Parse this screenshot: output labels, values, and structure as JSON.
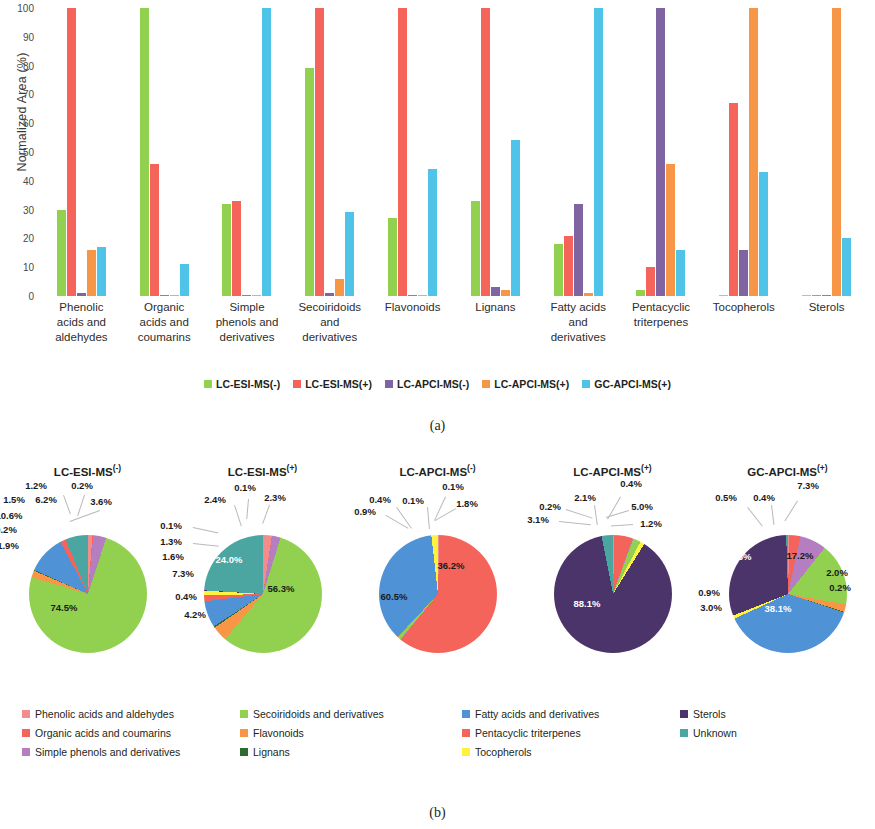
{
  "figure": {
    "caption_a": "(a)",
    "caption_b": "(b)"
  },
  "colors": {
    "lc_esi_neg": "#92D14F",
    "lc_esi_pos": "#F4645A",
    "lc_apci_neg": "#8064A2",
    "lc_apci_pos": "#F79646",
    "gc_apci_pos": "#4FC3E8",
    "phenolic_acids": "#F28D8D",
    "organic_acids": "#F4645A",
    "simple_phenols": "#B57EC1",
    "secoiridoids": "#92D14F",
    "flavonoids": "#F79646",
    "lignans": "#2E6B2E",
    "fatty_acids": "#4F93D6",
    "pentacyclic": "#F4645A",
    "tocopherols": "#FFF23F",
    "sterols": "#4B3469",
    "unknown": "#4BA5A0"
  },
  "chart_data": [
    {
      "type": "bar",
      "title": "",
      "xlabel": "",
      "ylabel": "Normalized Area (%)",
      "ylim": [
        0,
        100
      ],
      "yticks": [
        0,
        10,
        20,
        30,
        40,
        50,
        60,
        70,
        80,
        90,
        100
      ],
      "grid": false,
      "legend_position": "bottom",
      "categories": [
        "Phenolic acids and aldehydes",
        "Organic acids and coumarins",
        "Simple phenols and derivatives",
        "Secoiridoids and derivatives",
        "Flavonoids",
        "Lignans",
        "Fatty acids and derivatives",
        "Pentacyclic triterpenes",
        "Tocopherols",
        "Sterols"
      ],
      "category_lines": [
        [
          "Phenolic",
          "acids and",
          "aldehydes"
        ],
        [
          "Organic",
          "acids and",
          "coumarins"
        ],
        [
          "Simple",
          "phenols and",
          "derivatives"
        ],
        [
          "Secoiridoids",
          "and",
          "derivatives"
        ],
        [
          "Flavonoids"
        ],
        [
          "Lignans"
        ],
        [
          "Fatty acids",
          "and",
          "derivatives"
        ],
        [
          "Pentacyclic",
          "triterpenes"
        ],
        [
          "Tocopherols"
        ],
        [
          "Sterols"
        ]
      ],
      "series": [
        {
          "name": "LC-ESI-MS(-)",
          "color": "#92D14F",
          "values": [
            30,
            100,
            32,
            79,
            27,
            33,
            18,
            2,
            0,
            0
          ]
        },
        {
          "name": "LC-ESI-MS(+)",
          "color": "#F4645A",
          "values": [
            100,
            46,
            33,
            100,
            100,
            100,
            21,
            10,
            67,
            0
          ]
        },
        {
          "name": "LC-APCI-MS(-)",
          "color": "#8064A2",
          "values": [
            1,
            0,
            0,
            1,
            0,
            3,
            32,
            100,
            16,
            0
          ]
        },
        {
          "name": "LC-APCI-MS(+)",
          "color": "#F79646",
          "values": [
            16,
            0,
            0,
            6,
            0,
            2,
            1,
            46,
            100,
            100
          ]
        },
        {
          "name": "GC-APCI-MS(+)",
          "color": "#4FC3E8",
          "values": [
            17,
            11,
            100,
            29,
            44,
            54,
            100,
            16,
            43,
            20
          ]
        }
      ]
    },
    {
      "type": "pie",
      "title": "LC-ESI-MS(-)",
      "title_base": "LC-ESI-MS",
      "title_sup": "(-)",
      "labels": [
        "Phenolic acids and aldehydes",
        "Organic acids and coumarins",
        "Simple phenols and derivatives",
        "Secoiridoids and derivatives",
        "Flavonoids",
        "Lignans",
        "Fatty acids and derivatives",
        "Pentacyclic triterpenes",
        "Tocopherols",
        "Sterols",
        "Unknown"
      ],
      "values": [
        1.2,
        0.2,
        3.6,
        74.5,
        1.9,
        0.2,
        10.6,
        1.5,
        0.0,
        0.0,
        6.2
      ],
      "value_labels": [
        "1.2%",
        "0.2%",
        "3.6%",
        "74.5%",
        "1.9%",
        "0.2%",
        "10.6%",
        "1.5%",
        "",
        "",
        "6.2%"
      ]
    },
    {
      "type": "pie",
      "title": "LC-ESI-MS(+)",
      "title_base": "LC-ESI-MS",
      "title_sup": "(+)",
      "labels": [
        "Phenolic acids and aldehydes",
        "Organic acids and coumarins",
        "Simple phenols and derivatives",
        "Secoiridoids and derivatives",
        "Flavonoids",
        "Lignans",
        "Fatty acids and derivatives",
        "Pentacyclic triterpenes",
        "Tocopherols",
        "Sterols",
        "Unknown"
      ],
      "values": [
        2.4,
        0.1,
        2.3,
        56.3,
        4.2,
        0.4,
        7.3,
        1.6,
        1.3,
        0.1,
        24.0
      ],
      "value_labels": [
        "2.4%",
        "0.1%",
        "2.3%",
        "56.3%",
        "4.2%",
        "0.4%",
        "7.3%",
        "1.6%",
        "1.3%",
        "0.1%",
        "24.0%"
      ]
    },
    {
      "type": "pie",
      "title": "LC-APCI-MS(-)",
      "title_base": "LC-APCI-MS",
      "title_sup": "(-)",
      "labels": [
        "Phenolic acids and aldehydes",
        "Organic acids and coumarins",
        "Simple phenols and derivatives",
        "Secoiridoids and derivatives",
        "Flavonoids",
        "Lignans",
        "Fatty acids and derivatives",
        "Pentacyclic triterpenes",
        "Tocopherols",
        "Sterols",
        "Unknown"
      ],
      "values": [
        0.4,
        60.5,
        0.1,
        0.9,
        0.1,
        0.0,
        36.2,
        0.0,
        1.8,
        0.0,
        0.0
      ],
      "value_labels": [
        "0.4%",
        "60.5%",
        "0.1%",
        "0.9%",
        "0.1%",
        "",
        "36.2%",
        "",
        "1.8%",
        "",
        ""
      ]
    },
    {
      "type": "pie",
      "title": "LC-APCI-MS(+)",
      "title_base": "LC-APCI-MS",
      "title_sup": "(+)",
      "labels": [
        "Phenolic acids and aldehydes",
        "Organic acids and coumarins",
        "Simple phenols and derivatives",
        "Secoiridoids and derivatives",
        "Flavonoids",
        "Lignans",
        "Fatty acids and derivatives",
        "Pentacyclic triterpenes",
        "Tocopherols",
        "Sterols",
        "Unknown"
      ],
      "values": [
        0.4,
        5.0,
        0.2,
        2.1,
        0.0,
        0.0,
        0.0,
        0.0,
        1.2,
        88.1,
        3.1
      ],
      "value_labels": [
        "0.4%",
        "5.0%",
        "0.2%",
        "2.1%",
        "",
        "",
        "",
        "",
        "1.2%",
        "88.1%",
        "3.1%"
      ]
    },
    {
      "type": "pie",
      "title": "GC-APCI-MS(+)",
      "title_base": "GC-APCI-MS",
      "title_sup": "(+)",
      "labels": [
        "Phenolic acids and aldehydes",
        "Organic acids and coumarins",
        "Simple phenols and derivatives",
        "Secoiridoids and derivatives",
        "Flavonoids",
        "Lignans",
        "Fatty acids and derivatives",
        "Pentacyclic triterpenes",
        "Tocopherols",
        "Sterols",
        "Unknown"
      ],
      "values": [
        0.4,
        3.0,
        7.3,
        17.2,
        2.0,
        0.2,
        38.1,
        0.0,
        0.9,
        30.5,
        0.5
      ],
      "value_labels": [
        "0.4%",
        "3.0%",
        "7.3%",
        "17.2%",
        "2.0%",
        "0.2%",
        "38.1%",
        "",
        "0.9%",
        "30.5%",
        "0.5%"
      ]
    }
  ],
  "bar_legend": [
    {
      "label": "LC-ESI-MS(-)",
      "color": "#92D14F"
    },
    {
      "label": "LC-ESI-MS(+)",
      "color": "#F4645A"
    },
    {
      "label": "LC-APCI-MS(-)",
      "color": "#8064A2"
    },
    {
      "label": "LC-APCI-MS(+)",
      "color": "#F79646"
    },
    {
      "label": "GC-APCI-MS(+)",
      "color": "#4FC3E8"
    }
  ],
  "pie_legend": [
    {
      "label": "Phenolic acids and aldehydes",
      "color": "#F28D8D"
    },
    {
      "label": "Organic acids and coumarins",
      "color": "#F4645A"
    },
    {
      "label": "Simple phenols and derivatives",
      "color": "#B57EC1"
    },
    {
      "label": "Secoiridoids and derivatives",
      "color": "#92D14F"
    },
    {
      "label": "Flavonoids",
      "color": "#F79646"
    },
    {
      "label": "Lignans",
      "color": "#2E6B2E"
    },
    {
      "label": "Fatty acids and derivatives",
      "color": "#4F93D6"
    },
    {
      "label": "Pentacyclic triterpenes",
      "color": "#F4645A"
    },
    {
      "label": "Tocopherols",
      "color": "#FFF23F"
    },
    {
      "label": "Sterols",
      "color": "#4B3469"
    },
    {
      "label": "Unknown",
      "color": "#4BA5A0"
    }
  ],
  "pie_label_layout": [
    [
      {
        "t": "1.2%",
        "x": 36,
        "y": 30,
        "cls": ""
      },
      {
        "t": "1.5%",
        "x": 14,
        "y": 44,
        "cls": ""
      },
      {
        "t": "6.2%",
        "x": 46,
        "y": 44,
        "cls": ""
      },
      {
        "t": "10.6%",
        "x": 9,
        "y": 60,
        "cls": ""
      },
      {
        "t": "0.2%",
        "x": 6,
        "y": 74,
        "cls": ""
      },
      {
        "t": "1.9%",
        "x": 8,
        "y": 90,
        "cls": ""
      },
      {
        "t": "0.2%",
        "x": 82,
        "y": 30,
        "cls": ""
      },
      {
        "t": "3.6%",
        "x": 101,
        "y": 46,
        "cls": ""
      },
      {
        "t": "74.5%",
        "x": 64,
        "y": 152,
        "cls": "inside"
      }
    ],
    [
      {
        "t": "2.4%",
        "x": 40,
        "y": 44,
        "cls": ""
      },
      {
        "t": "0.1%",
        "x": 70,
        "y": 32,
        "cls": ""
      },
      {
        "t": "2.3%",
        "x": 100,
        "y": 42,
        "cls": ""
      },
      {
        "t": "0.1%",
        "x": -4,
        "y": 70,
        "cls": ""
      },
      {
        "t": "1.3%",
        "x": -4,
        "y": 86,
        "cls": ""
      },
      {
        "t": "1.6%",
        "x": -2,
        "y": 101,
        "cls": ""
      },
      {
        "t": "7.3%",
        "x": 8,
        "y": 118,
        "cls": ""
      },
      {
        "t": "0.4%",
        "x": 11,
        "y": 141,
        "cls": ""
      },
      {
        "t": "4.2%",
        "x": 20,
        "y": 159,
        "cls": ""
      },
      {
        "t": "24.0%",
        "x": 54,
        "y": 104,
        "cls": "inside-light"
      },
      {
        "t": "56.3%",
        "x": 106,
        "y": 133,
        "cls": "inside"
      }
    ],
    [
      {
        "t": "0.4%",
        "x": 30,
        "y": 44,
        "cls": ""
      },
      {
        "t": "0.1%",
        "x": 63,
        "y": 45,
        "cls": ""
      },
      {
        "t": "0.1%",
        "x": 103,
        "y": 31,
        "cls": ""
      },
      {
        "t": "0.9%",
        "x": 15,
        "y": 56,
        "cls": ""
      },
      {
        "t": "1.8%",
        "x": 117,
        "y": 48,
        "cls": ""
      },
      {
        "t": "36.2%",
        "x": 101,
        "y": 110,
        "cls": "inside"
      },
      {
        "t": "60.5%",
        "x": 44,
        "y": 141,
        "cls": "inside"
      }
    ],
    [
      {
        "t": "0.2%",
        "x": 25,
        "y": 51,
        "cls": ""
      },
      {
        "t": "3.1%",
        "x": 13,
        "y": 64,
        "cls": ""
      },
      {
        "t": "2.1%",
        "x": 60,
        "y": 42,
        "cls": ""
      },
      {
        "t": "0.4%",
        "x": 106,
        "y": 28,
        "cls": ""
      },
      {
        "t": "5.0%",
        "x": 117,
        "y": 51,
        "cls": ""
      },
      {
        "t": "1.2%",
        "x": 126,
        "y": 68,
        "cls": ""
      },
      {
        "t": "88.1%",
        "x": 62,
        "y": 148,
        "cls": "inside-light"
      }
    ],
    [
      {
        "t": "0.5%",
        "x": 26,
        "y": 42,
        "cls": ""
      },
      {
        "t": "0.4%",
        "x": 64,
        "y": 42,
        "cls": ""
      },
      {
        "t": "7.3%",
        "x": 108,
        "y": 30,
        "cls": ""
      },
      {
        "t": "17.2%",
        "x": 100,
        "y": 100,
        "cls": "inside"
      },
      {
        "t": "2.0%",
        "x": 137,
        "y": 117,
        "cls": ""
      },
      {
        "t": "0.2%",
        "x": 140,
        "y": 132,
        "cls": ""
      },
      {
        "t": "38.1%",
        "x": 78,
        "y": 153,
        "cls": "inside-light"
      },
      {
        "t": "3.0%",
        "x": 11,
        "y": 152,
        "cls": ""
      },
      {
        "t": "0.9%",
        "x": 9,
        "y": 137,
        "cls": ""
      },
      {
        "t": "30.5%",
        "x": 38,
        "y": 101,
        "cls": "inside-light"
      }
    ]
  ],
  "pie_leaders": [
    [
      {
        "x": 64,
        "y": 40,
        "len": 20,
        "rot": 70
      },
      {
        "x": 85,
        "y": 40,
        "len": 22,
        "rot": 108
      },
      {
        "x": 100,
        "y": 56,
        "len": 32,
        "rot": 160
      }
    ],
    [
      {
        "x": 60,
        "y": 50,
        "len": 22,
        "rot": 72
      },
      {
        "x": 74,
        "y": 44,
        "len": 20,
        "rot": 95
      },
      {
        "x": 95,
        "y": 50,
        "len": 20,
        "rot": 110
      },
      {
        "x": 18,
        "y": 72,
        "len": 26,
        "rot": 12
      },
      {
        "x": 18,
        "y": 88,
        "len": 26,
        "rot": 6
      }
    ],
    [
      {
        "x": 47,
        "y": 52,
        "len": 26,
        "rot": 55
      },
      {
        "x": 36,
        "y": 60,
        "len": 26,
        "rot": 30
      },
      {
        "x": 78,
        "y": 52,
        "len": 22,
        "rot": 85
      },
      {
        "x": 96,
        "y": 42,
        "len": 26,
        "rot": 115
      },
      {
        "x": 106,
        "y": 54,
        "len": 24,
        "rot": 150
      }
    ],
    [
      {
        "x": 41,
        "y": 54,
        "len": 28,
        "rot": 18
      },
      {
        "x": 34,
        "y": 66,
        "len": 32,
        "rot": 6
      },
      {
        "x": 70,
        "y": 50,
        "len": 20,
        "rot": 82
      },
      {
        "x": 96,
        "y": 42,
        "len": 26,
        "rot": 120
      },
      {
        "x": 104,
        "y": 56,
        "len": 24,
        "rot": 163
      },
      {
        "x": 108,
        "y": 70,
        "len": 22,
        "rot": 176
      }
    ],
    [
      {
        "x": 48,
        "y": 52,
        "len": 24,
        "rot": 52
      },
      {
        "x": 72,
        "y": 50,
        "len": 20,
        "rot": 83
      },
      {
        "x": 98,
        "y": 46,
        "len": 24,
        "rot": 122
      }
    ]
  ]
}
